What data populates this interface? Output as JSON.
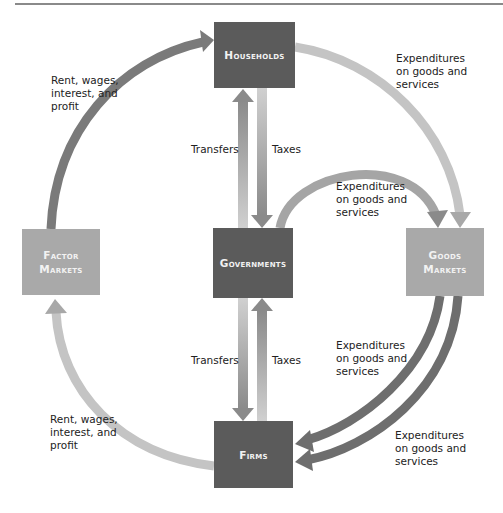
{
  "diagram": {
    "nodes": {
      "households": "Households",
      "governments": "Governments",
      "factor_markets": "Factor\nMarkets",
      "goods_markets": "Goods\nMarkets",
      "firms": "Firms"
    },
    "labels": {
      "factor_to_households": "Rent, wages,\ninterest, and\nprofit",
      "households_to_goods": "Expenditures\non goods and\nservices",
      "gov_to_goods": "Expenditures\non goods and\nservices",
      "upper_transfers": "Transfers",
      "upper_taxes": "Taxes",
      "lower_transfers": "Transfers",
      "lower_taxes": "Taxes",
      "goods_to_firms_inner": "Expenditures\non goods and\nservices",
      "goods_to_firms_outer": "Expenditures\non goods and\nservices",
      "firms_to_factor": "Rent, wages,\ninterest, and\nprofit"
    },
    "colors": {
      "dark_box": "#5b5b5b",
      "light_box": "#a9a9a9",
      "dark_arrow": "#777777",
      "light_arrow": "#c4c4c4"
    }
  }
}
